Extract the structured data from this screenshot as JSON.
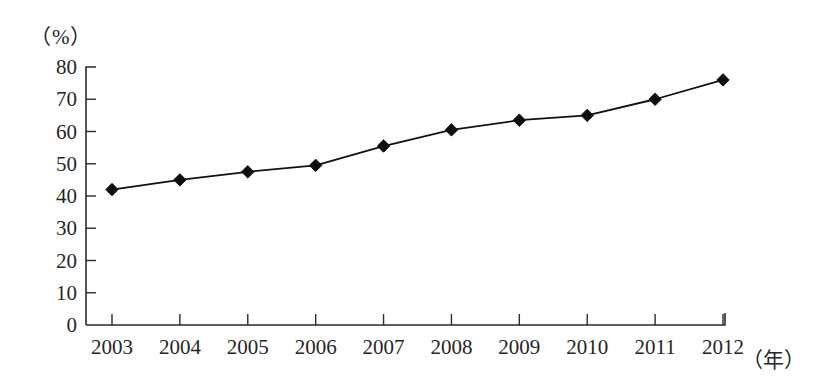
{
  "chart_data": {
    "type": "line",
    "title": "",
    "xlabel": "（年）",
    "ylabel": "（%）",
    "categories": [
      "2003",
      "2004",
      "2005",
      "2006",
      "2007",
      "2008",
      "2009",
      "2010",
      "2011",
      "2012"
    ],
    "values": [
      42,
      45,
      47.5,
      49.5,
      55.5,
      60.5,
      63.5,
      65,
      70,
      76
    ],
    "series": [
      {
        "name": "",
        "values": [
          42,
          45,
          47.5,
          49.5,
          55.5,
          60.5,
          63.5,
          65,
          70,
          76
        ]
      }
    ],
    "ylim": [
      0,
      80
    ],
    "ytick_labels": [
      "0",
      "10",
      "20",
      "30",
      "40",
      "50",
      "60",
      "70",
      "80"
    ],
    "ytick_values": [
      0,
      10,
      20,
      30,
      40,
      50,
      60,
      70,
      80
    ],
    "xtick_labels": [
      "2003",
      "2004",
      "2005",
      "2006",
      "2007",
      "2008",
      "2009",
      "2010",
      "2011",
      "2012"
    ],
    "grid": false,
    "legend": "none",
    "marker": "diamond",
    "line_color": "#111111",
    "marker_color": "#0d0d0d",
    "axis_color": "#2b2b2b"
  },
  "axes": {
    "y_unit": "（%）",
    "x_unit": "（年）"
  }
}
